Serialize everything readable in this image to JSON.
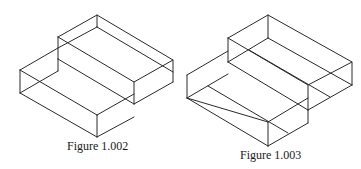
{
  "figures": [
    {
      "id": "fig-1-002",
      "caption": "Figure 1.002",
      "description": "Isometric wireframe of two stacked rectangular boxes (step shape)"
    },
    {
      "id": "fig-1-003",
      "caption": "Figure 1.003",
      "description": "Isometric wireframe of two stacked rectangular boxes with additional parallel surface lines"
    }
  ],
  "style": {
    "line_color": "#2a2a2a",
    "background": "#ffffff"
  }
}
